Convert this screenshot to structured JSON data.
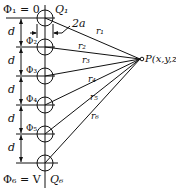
{
  "diagram": {
    "top_label": "Φ₁ = 0",
    "bottom_label": "Φ₆ = V",
    "charges": [
      "Q₁",
      "Q₆"
    ],
    "potentials": [
      "Φ₂",
      "Φ₃",
      "Φ₄",
      "Φ₅"
    ],
    "spacing_label": "d",
    "diameter_label": "2a",
    "distances": [
      "r₁",
      "r₂",
      "r₃",
      "r₄",
      "r₅",
      "r₆"
    ],
    "point_label": "P(x,y,z)",
    "ring_centers_y": [
      18,
      47,
      76,
      105,
      134,
      163
    ],
    "ring_center_x": 45,
    "ring_radius": 8,
    "point": {
      "x": 141,
      "y": 59
    }
  }
}
